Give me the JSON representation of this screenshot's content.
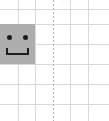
{
  "canvas": {
    "width": 109,
    "height": 121,
    "background_color": "#ffffff",
    "description": "spreadsheet-grid-crop"
  },
  "grid": {
    "line_color": "#d9d9d9",
    "horizontal_positions": [
      9,
      24,
      44,
      64,
      84,
      104
    ],
    "vertical_positions": [
      18,
      35,
      70,
      88
    ]
  },
  "page_break": {
    "label": "page-break-line",
    "orientation": "vertical",
    "x": 53,
    "color": "#b4b4b4",
    "style": "dotted"
  },
  "smiley": {
    "label": "smiley-face",
    "fill_color": "#adadad",
    "feature_color": "#1c1c1c",
    "x": 0,
    "y": 24,
    "width": 35,
    "height": 40,
    "mouth_shape": "u-shape",
    "eye_count": 2
  },
  "clipped_row": {
    "left_glyph": "·",
    "right_glyph": "▭"
  }
}
